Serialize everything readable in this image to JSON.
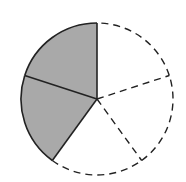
{
  "diagram": {
    "type": "fraction-circle",
    "total_parts": 5,
    "shaded_parts": 2,
    "fraction": "2/5",
    "center": [
      97,
      99
    ],
    "radius": 76,
    "start_angle_deg": 90,
    "colors": {
      "shaded_fill": "#a9a9a9",
      "unshaded_fill": "#ffffff",
      "stroke": "#222222"
    },
    "sectors": [
      {
        "index": 0,
        "from_deg": 90,
        "to_deg": 162,
        "shaded": true,
        "outline": "solid"
      },
      {
        "index": 1,
        "from_deg": 162,
        "to_deg": 234,
        "shaded": true,
        "outline": "solid"
      },
      {
        "index": 2,
        "from_deg": 234,
        "to_deg": 306,
        "shaded": false,
        "outline": "dashed"
      },
      {
        "index": 3,
        "from_deg": 306,
        "to_deg": 378,
        "shaded": false,
        "outline": "dashed"
      },
      {
        "index": 4,
        "from_deg": 18,
        "to_deg": 90,
        "shaded": false,
        "outline": "dashed"
      }
    ]
  }
}
